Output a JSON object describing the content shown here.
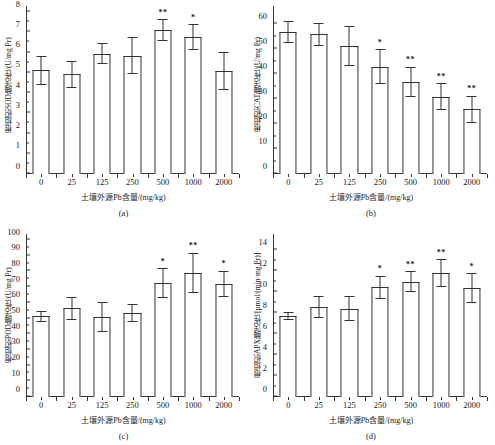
{
  "figure": {
    "xlabel": "土壤外源Pb含量/(mg/kg)",
    "categories": [
      "0",
      "25",
      "125",
      "250",
      "500",
      "1000",
      "2000"
    ]
  },
  "chart_data": [
    {
      "type": "bar",
      "panel": "(a)",
      "title": "",
      "ylabel": "根组织SOD酶活性/(U/mg Pr)",
      "xlabel": "土壤外源Pb含量/(mg/kg)",
      "categories": [
        "0",
        "25",
        "125",
        "250",
        "500",
        "1000",
        "2000"
      ],
      "values": [
        5.12,
        4.92,
        5.95,
        5.85,
        7.1,
        6.75,
        5.08
      ],
      "errors": [
        0.7,
        0.65,
        0.52,
        0.9,
        0.55,
        0.65,
        0.95
      ],
      "significance": [
        "",
        "",
        "",
        "",
        "**",
        "*",
        ""
      ],
      "ylim": [
        0,
        8
      ],
      "yticks": [
        0,
        1,
        2,
        3,
        4,
        5,
        6,
        7,
        8
      ],
      "grid": false
    },
    {
      "type": "bar",
      "panel": "(b)",
      "title": "",
      "ylabel": "根组织CAT酶活性/(U/mg Pr)",
      "xlabel": "土壤外源Pb含量/(mg/kg)",
      "categories": [
        "0",
        "25",
        "125",
        "250",
        "500",
        "1000",
        "2000"
      ],
      "values": [
        57.0,
        56.0,
        51.5,
        43.0,
        37.0,
        31.0,
        26.0
      ],
      "errors": [
        4.5,
        4.5,
        8.0,
        7.0,
        6.0,
        5.5,
        5.5
      ],
      "significance": [
        "",
        "",
        "",
        "*",
        "**",
        "**",
        "**"
      ],
      "ylim": [
        0,
        65
      ],
      "yticks": [
        0,
        10,
        20,
        30,
        40,
        50,
        60
      ],
      "grid": false
    },
    {
      "type": "bar",
      "panel": "(c)",
      "title": "",
      "ylabel": "根组织POD酶活性/(U/mg Pr)",
      "xlabel": "土壤外源Pb含量/(mg/kg)",
      "categories": [
        "0",
        "25",
        "125",
        "250",
        "500",
        "1000",
        "2000"
      ],
      "values": [
        51.5,
        56.5,
        51.0,
        53.5,
        72.5,
        79.0,
        72.0
      ],
      "errors": [
        3.5,
        7.5,
        9.5,
        5.5,
        9.5,
        13.0,
        8.5
      ],
      "significance": [
        "",
        "",
        "",
        "",
        "*",
        "**",
        "*"
      ],
      "ylim": [
        0,
        100
      ],
      "yticks": [
        0,
        10,
        20,
        30,
        40,
        50,
        60,
        70,
        80,
        90,
        100
      ],
      "grid": false
    },
    {
      "type": "bar",
      "panel": "(d)",
      "title": "",
      "ylabel": "根组织APX酶活性/[μmol/(min·mg Pr)]",
      "xlabel": "土壤外源Pb含量/(mg/kg)",
      "categories": [
        "0",
        "25",
        "125",
        "250",
        "500",
        "1000",
        "2000"
      ],
      "values": [
        7.75,
        8.6,
        8.45,
        10.5,
        11.0,
        11.85,
        10.4
      ],
      "errors": [
        0.4,
        1.05,
        1.2,
        1.1,
        1.0,
        1.3,
        1.45
      ],
      "significance": [
        "",
        "",
        "",
        "*",
        "**",
        "**",
        "*"
      ],
      "ylim": [
        0,
        15
      ],
      "yticks": [
        0,
        2,
        4,
        6,
        8,
        10,
        12,
        14
      ],
      "grid": false
    }
  ]
}
